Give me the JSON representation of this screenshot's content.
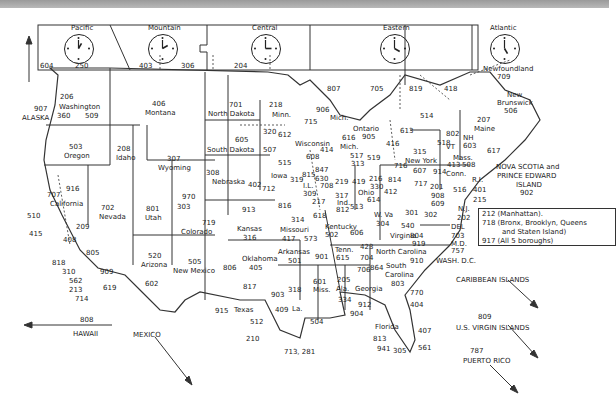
{
  "time_zones": [
    {
      "name": "Pacific",
      "hour": 1,
      "codes": [
        "250"
      ]
    },
    {
      "name": "Mountain",
      "hour": 2,
      "codes": [
        "403",
        "306"
      ]
    },
    {
      "name": "Central",
      "hour": 3,
      "codes": [
        "204"
      ]
    },
    {
      "name": "Eastern",
      "hour": 4,
      "codes": [
        "807",
        "705",
        "819",
        "418"
      ]
    },
    {
      "name": "Atlantic",
      "hour": 5,
      "codes": []
    }
  ],
  "canada": {
    "bc": "604",
    "newfoundland": {
      "name": "Newfoundland",
      "code": "709"
    },
    "new_brunswick": {
      "name": "New Brunswick",
      "code": "506"
    },
    "nova_scotia": {
      "name": "NOVA SCOTIA and PRINCE EDWARD ISLAND",
      "code": "902"
    },
    "ontario": {
      "name": "Ontario",
      "code": "905"
    }
  },
  "states": [
    {
      "name": "ALASKA",
      "codes": "907"
    },
    {
      "name": "Washington",
      "codes": "206 360 509"
    },
    {
      "name": "Oregon",
      "codes": "503"
    },
    {
      "name": "California",
      "codes": "707 916 510 415 209 408 805 818 310 562 213 714 909 619"
    },
    {
      "name": "Idaho",
      "codes": "208"
    },
    {
      "name": "Nevada",
      "codes": "702"
    },
    {
      "name": "Montana",
      "codes": "406"
    },
    {
      "name": "Wyoming",
      "codes": "307"
    },
    {
      "name": "Utah",
      "codes": "801"
    },
    {
      "name": "Colorado",
      "codes": "970 303 719"
    },
    {
      "name": "Arizona",
      "codes": "520 602"
    },
    {
      "name": "New Mexico",
      "codes": "505"
    },
    {
      "name": "North Dakota",
      "codes": "701"
    },
    {
      "name": "South Dakota",
      "codes": "605"
    },
    {
      "name": "Nebraska",
      "codes": "308 402"
    },
    {
      "name": "Kansas",
      "codes": "913 316"
    },
    {
      "name": "Oklahoma",
      "codes": "405 918"
    },
    {
      "name": "Texas",
      "codes": "806 817 903 915 409 512 210 713, 281"
    },
    {
      "name": "Minn.",
      "codes": "218 320 612 507"
    },
    {
      "name": "Iowa",
      "codes": "515 712 319"
    },
    {
      "name": "Missouri",
      "codes": "816 314 417 573"
    },
    {
      "name": "Arkansas",
      "codes": "501"
    },
    {
      "name": "La.",
      "codes": "318 504"
    },
    {
      "name": "Wisconsin",
      "codes": "715 414 608"
    },
    {
      "name": "IL",
      "codes": "815 847 630 708 312 309 217 618"
    },
    {
      "name": "Mich.",
      "codes": "906 616 517 313 810"
    },
    {
      "name": "Ind.",
      "codes": "219 317 812"
    },
    {
      "name": "Ohio",
      "codes": "419 216 330 614 513"
    },
    {
      "name": "Kentucky",
      "codes": "502 606"
    },
    {
      "name": "Tenn.",
      "codes": "901 615 423"
    },
    {
      "name": "Miss.",
      "codes": "601"
    },
    {
      "name": "Ala.",
      "codes": "205 334"
    },
    {
      "name": "Georgia",
      "codes": "706 404 770 912"
    },
    {
      "name": "Florida",
      "codes": "904 813 941 407 561 305"
    },
    {
      "name": "South Carolina",
      "codes": "864 803"
    },
    {
      "name": "North Carolina",
      "codes": "704 919 910"
    },
    {
      "name": "Virginia",
      "codes": "540 804 757"
    },
    {
      "name": "W. Va",
      "codes": "304"
    },
    {
      "name": "New York",
      "codes": "716 315 607 518 914"
    },
    {
      "name": "Penn.",
      "codes": "814 412 717 215 610"
    },
    {
      "name": "N.J.",
      "codes": "201 908 609"
    },
    {
      "name": "DEL",
      "codes": "302"
    },
    {
      "name": "M.D.",
      "codes": "301 410"
    },
    {
      "name": "VT",
      "codes": "802"
    },
    {
      "name": "NH",
      "codes": "603"
    },
    {
      "name": "Maine",
      "codes": "207"
    },
    {
      "name": "Mass.",
      "codes": "413 508 617"
    },
    {
      "name": "Conn.",
      "codes": "203"
    },
    {
      "name": "R.I.",
      "codes": "401"
    },
    {
      "name": "WASH, D.C.",
      "codes": "202"
    }
  ],
  "nyc_box": [
    "212 (Manhattan).",
    "718 (Bronx, Brooklyn, Queens",
    "and Staten Island)",
    "917 (All 5 boroughs)"
  ],
  "offshore": {
    "hawaii": {
      "name": "HAWAII",
      "code": "808"
    },
    "mexico": {
      "name": "MEXICO"
    },
    "caribbean": {
      "name": "CARIBBEAN ISLANDS",
      "code": "809"
    },
    "virgin": {
      "name": "U.S. VIRGIN ISLANDS"
    },
    "puerto_rico": {
      "name": "PUERTO RICO",
      "code": "787"
    }
  },
  "labels": {
    "tz_pacific": "Pacific",
    "tz_mountain": "Mountain",
    "tz_central": "Central",
    "tz_eastern": "Eastern",
    "tz_atlantic": "Atlantic",
    "c250": "250",
    "c403": "403",
    "c306": "306",
    "c204": "204",
    "c807": "807",
    "c705": "705",
    "c819": "819",
    "c418": "418",
    "c604": "604",
    "newfoundland": "Newfoundland",
    "c709": "709",
    "newbrunswick": "New",
    "newbrunswick2": "Brunswick",
    "c506": "506",
    "ns1": "NOVA SCOTIA and",
    "ns2": "PRINCE EDWARD",
    "ns3": "ISLAND",
    "c902": "902",
    "c907": "907",
    "alaska": "ALASKA",
    "c206": "206",
    "washington": "Washington",
    "c360": "360",
    "c509": "509",
    "c503": "503",
    "oregon": "Oregon",
    "c208": "208",
    "idaho": "Idaho",
    "c406": "406",
    "montana": "Montana",
    "c307": "307",
    "wyoming": "Wyoming",
    "c916": "916",
    "c707": "707",
    "california": "California",
    "c510": "510",
    "c415": "415",
    "c209": "209",
    "c408": "408",
    "c805": "805",
    "c818": "818",
    "c310": "310",
    "c562": "562",
    "c213": "213",
    "c714": "714",
    "c909": "909",
    "c619": "619",
    "c702": "702",
    "nevada": "Nevada",
    "c801": "801",
    "utah": "Utah",
    "c970": "970",
    "c303": "303",
    "c719": "719",
    "colorado": "Colorado",
    "c520": "520",
    "arizona": "Arizona",
    "c602": "602",
    "c505": "505",
    "newmexico": "New Mexico",
    "c701": "701",
    "northdakota": "North Dakota",
    "c605": "605",
    "southdakota": "South Dakota",
    "c308": "308",
    "nebraska": "Nebraska",
    "c402": "402",
    "c913": "913",
    "kansas": "Kansas",
    "c316": "316",
    "c806": "806",
    "c405": "405",
    "oklahoma": "Oklahoma",
    "c918": "918",
    "c817": "817",
    "c903": "903",
    "c915": "915",
    "texas": "Texas",
    "c409": "409",
    "c512": "512",
    "c210": "210",
    "c713": "713, 281",
    "c218": "218",
    "minn": "Minn.",
    "c320": "320",
    "c612": "612",
    "c507": "507",
    "c515": "515",
    "iowa": "Iowa",
    "c712": "712",
    "c319": "319",
    "c816": "816",
    "c314": "314",
    "missouri": "Missouri",
    "c417": "417",
    "c573": "573",
    "arkansas": "Arkansas",
    "c501": "501",
    "c318": "318",
    "la": "La.",
    "c504": "504",
    "c715": "715",
    "wisconsin": "Wisconsin",
    "c414": "414",
    "c608": "608",
    "c906": "906",
    "mich": "Mich.",
    "c616": "616",
    "mich2": "Mich.",
    "c517": "517",
    "c313": "313",
    "c810": "810",
    "ontario": "Ontario",
    "c905": "905",
    "c519": "519",
    "c416": "416",
    "c613": "613",
    "c514": "514",
    "c815": "815",
    "c847": "847",
    "c630": "630",
    "c708": "708",
    "c312": "312",
    "il": "I.L.",
    "c309": "309",
    "c217": "217",
    "c618": "618",
    "c219": "219",
    "c317": "317",
    "ind": "Ind.",
    "c812": "812",
    "c419": "419",
    "c216": "216",
    "c330": "330",
    "ohio": "Ohio",
    "c614": "614",
    "c513": "513",
    "kentucky": "Kentucky",
    "c502": "502",
    "c606": "606",
    "c901": "901",
    "tenn": "Tenn.",
    "c615": "615",
    "c423": "423",
    "c601": "601",
    "miss": "Miss.",
    "c205": "205",
    "ala": "Ala.",
    "c334": "334",
    "c706": "706",
    "georgia": "Georgia",
    "c912": "912",
    "c404": "404",
    "c770": "770",
    "c904": "904",
    "florida": "Florida",
    "c813": "813",
    "c941": "941",
    "c305": "305",
    "c407": "407",
    "c561": "561",
    "c864": "864",
    "southcarolina": "South",
    "southcarolina2": "Carolina",
    "c803": "803",
    "c704": "704",
    "northcarolina": "North Carolina",
    "c919": "919",
    "c910": "910",
    "c304": "304",
    "wva": "W. Va",
    "c540": "540",
    "virginia": "Virginia",
    "c804": "804",
    "c757": "757",
    "c301": "301",
    "c302": "302",
    "c410": "410",
    "c716": "716",
    "c315": "315",
    "newyork": "New York",
    "c607": "607",
    "c518": "518",
    "c914": "914",
    "c814": "814",
    "c412": "412",
    "c717": "717",
    "c201": "201",
    "c908": "908",
    "c609": "609",
    "nj": "N.J.",
    "c202": "202",
    "del": "DEL",
    "c703": "703",
    "md": "M.D.",
    "washdc": "WASH. D.C.",
    "c802": "802",
    "vt": "VT",
    "nh": "NH",
    "c603": "603",
    "c207": "207",
    "maine": "Maine",
    "mass": "Mass.",
    "c413": "413",
    "c508": "508",
    "c617": "617",
    "conn": "Conn.",
    "c516": "516",
    "ri": "R.I.",
    "c401": "401",
    "c215": "215",
    "c808": "808",
    "hawaii": "HAWAII",
    "mexico": "MEXICO",
    "caribbean": "CARIBBEAN ISLANDS",
    "c809": "809",
    "virgin": "U.S. VIRGIN ISLANDS",
    "c787": "787",
    "puertorico": "PUERTO RICO"
  }
}
